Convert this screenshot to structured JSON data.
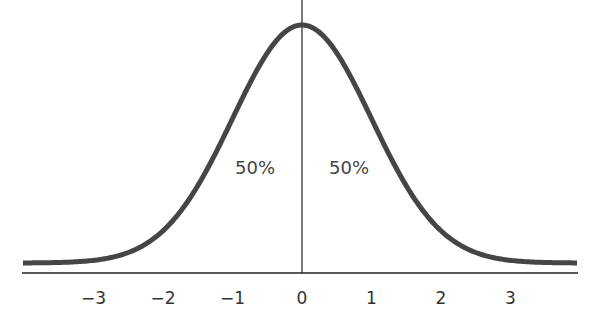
{
  "chart_data": {
    "type": "line",
    "title": "",
    "xlabel": "",
    "ylabel": "",
    "xlim": [
      -4,
      4
    ],
    "x_ticks": [
      -3,
      -2,
      -1,
      0,
      1,
      2,
      3
    ],
    "tick_labels": [
      "−3",
      "−2",
      "−1",
      "0",
      "1",
      "2",
      "3"
    ],
    "series": [
      {
        "name": "Standard normal curve",
        "function": "exp(-x^2/2)",
        "peak_x": 0
      }
    ],
    "annotations": [
      {
        "text": "50%",
        "side": "left"
      },
      {
        "text": "50%",
        "side": "right"
      }
    ],
    "center_line_x": 0,
    "grid": false,
    "legend": false
  },
  "labels": {
    "left_pct": "50%",
    "right_pct": "50%"
  },
  "colors": {
    "curve": "#454545",
    "axis": "#222222"
  }
}
